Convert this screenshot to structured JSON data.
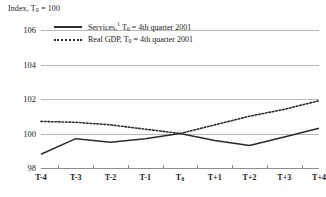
{
  "axis_title": "Index, T",
  "axis_title_sub": "0",
  "axis_title_tail": " = 100",
  "legend": [
    {
      "style": "solid",
      "label_main": "Services,",
      "label_sup": "1",
      "label_mid": " T",
      "label_sub": "0",
      "label_tail": " = 4th quarter 2001"
    },
    {
      "style": "dotted",
      "label_main": "Real GDP, T",
      "label_sup": "",
      "label_mid": "",
      "label_sub": "0",
      "label_tail": " = 4th quarter 2001"
    }
  ],
  "chart_data": {
    "type": "line",
    "title": "Index, T0 = 100",
    "xlabel": "",
    "ylabel": "Index, T0 = 100",
    "x": [
      "T-4",
      "T-3",
      "T-2",
      "T-1",
      "T0",
      "T+1",
      "T+2",
      "T+3",
      "T+4"
    ],
    "categories": [
      "T-4",
      "T-3",
      "T-2",
      "T-1",
      "T0",
      "T+1",
      "T+2",
      "T+3",
      "T+4"
    ],
    "ylim": [
      98,
      106
    ],
    "yticks": [
      98,
      100,
      102,
      104,
      106
    ],
    "ytick_labels": [
      "98",
      "100",
      "102",
      "104",
      "106"
    ],
    "grid": true,
    "legend_position": "top-left",
    "series": [
      {
        "name": "Services, T0 = 4th quarter 2001",
        "style": "solid",
        "color": "#2b2b2b",
        "values": [
          98.8,
          99.7,
          99.5,
          99.7,
          100.0,
          99.6,
          99.3,
          99.8,
          100.3
        ]
      },
      {
        "name": "Real GDP, T0 = 4th quarter 2001",
        "style": "dotted",
        "color": "#2b2b2b",
        "values": [
          100.7,
          100.65,
          100.5,
          100.25,
          100.0,
          100.5,
          101.0,
          101.4,
          101.9
        ]
      }
    ]
  }
}
